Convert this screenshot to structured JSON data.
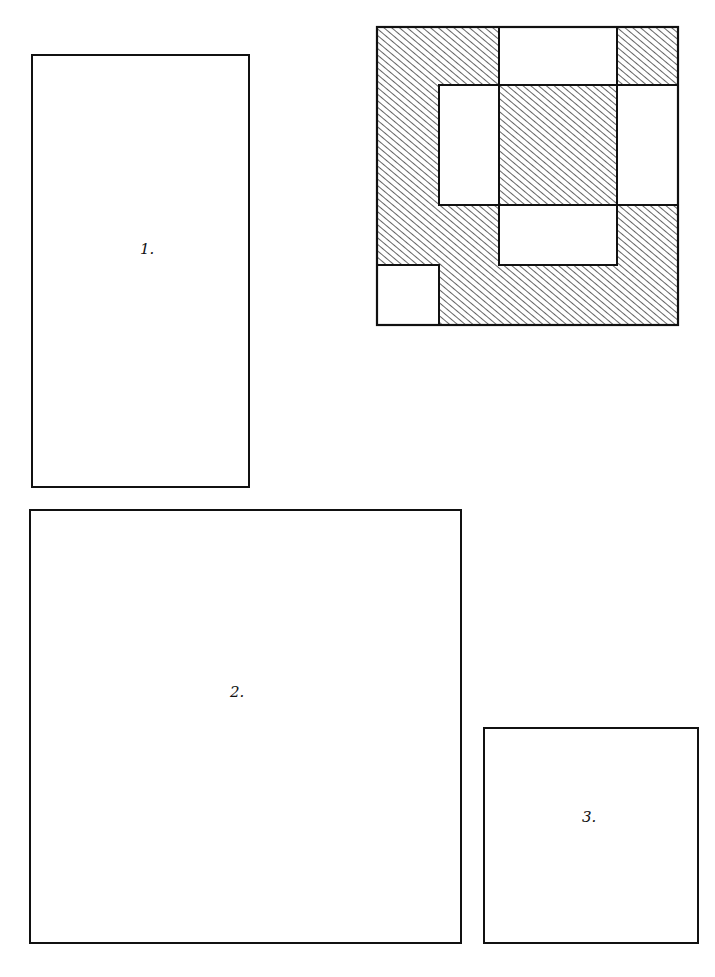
{
  "diagram": {
    "type": "quilt-layout-sketch",
    "stroke_color": "#111111",
    "background": "#ffffff",
    "panels": [
      {
        "id": "panel-1",
        "label": "1.",
        "x": 31,
        "y": 54,
        "w": 219,
        "h": 434,
        "label_x": 138,
        "label_y": 238
      },
      {
        "id": "panel-2",
        "label": "2.",
        "x": 29,
        "y": 509,
        "w": 433,
        "h": 435,
        "label_x": 230,
        "label_y": 682
      },
      {
        "id": "panel-3",
        "label": "3.",
        "x": 483,
        "y": 727,
        "w": 216,
        "h": 217,
        "label_x": 581,
        "label_y": 808
      }
    ],
    "quilt_block": {
      "x": 377,
      "y": 27,
      "w": 301,
      "h": 298,
      "grid_x": [
        377,
        439,
        499,
        617,
        678
      ],
      "grid_y": [
        27,
        85,
        145,
        205,
        265,
        325
      ],
      "white_regions": [
        {
          "name": "top-center",
          "x": 499,
          "y": 27,
          "w": 118,
          "h": 58
        },
        {
          "name": "middle-left",
          "x": 439,
          "y": 85,
          "w": 60,
          "h": 120
        },
        {
          "name": "middle-right",
          "x": 617,
          "y": 85,
          "w": 61,
          "h": 120
        },
        {
          "name": "lower-center",
          "x": 499,
          "y": 205,
          "w": 118,
          "h": 60
        },
        {
          "name": "bottom-left-corner",
          "x": 377,
          "y": 265,
          "w": 62,
          "h": 60
        }
      ],
      "hatched_regions": [
        "top-left",
        "top-right",
        "center-square",
        "left-column",
        "bottom-band"
      ]
    }
  }
}
